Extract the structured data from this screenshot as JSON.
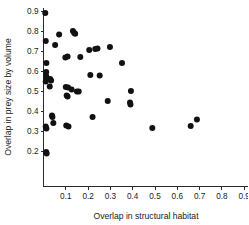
{
  "chart_data": {
    "type": "scatter",
    "title": "",
    "xlabel": "Overlap in structural habitat",
    "ylabel": "Overlap in prey size by volume",
    "xlim": [
      0.0,
      0.93
    ],
    "ylim": [
      0.13,
      0.93
    ],
    "xticks": [
      0.1,
      0.2,
      0.3,
      0.4,
      0.5,
      0.6,
      0.7,
      0.8,
      0.9
    ],
    "xtick_labels": [
      "0.1",
      "0.2",
      "0.3",
      "0.4",
      "0.5",
      "0.6",
      "0.7",
      "0.8",
      "0.9"
    ],
    "yticks": [
      0.2,
      0.3,
      0.4,
      0.5,
      0.6,
      0.7,
      0.8,
      0.9
    ],
    "ytick_labels": [
      "0.2",
      "0.3",
      "0.4",
      "0.5",
      "0.6",
      "0.7",
      "0.8",
      "0.9"
    ],
    "grid": false,
    "legend": false,
    "marker": "filled-circle",
    "marker_color": "#111111",
    "marker_size": 3.0,
    "points": [
      {
        "x": 0.008,
        "y": 0.89
      },
      {
        "x": 0.01,
        "y": 0.75
      },
      {
        "x": 0.013,
        "y": 0.64
      },
      {
        "x": 0.012,
        "y": 0.595
      },
      {
        "x": 0.012,
        "y": 0.575
      },
      {
        "x": 0.014,
        "y": 0.558
      },
      {
        "x": 0.01,
        "y": 0.548
      },
      {
        "x": 0.03,
        "y": 0.56
      },
      {
        "x": 0.034,
        "y": 0.553
      },
      {
        "x": 0.028,
        "y": 0.522
      },
      {
        "x": 0.01,
        "y": 0.322
      },
      {
        "x": 0.013,
        "y": 0.312
      },
      {
        "x": 0.012,
        "y": 0.195
      },
      {
        "x": 0.014,
        "y": 0.188
      },
      {
        "x": 0.038,
        "y": 0.378
      },
      {
        "x": 0.04,
        "y": 0.37
      },
      {
        "x": 0.044,
        "y": 0.34
      },
      {
        "x": 0.052,
        "y": 0.73
      },
      {
        "x": 0.07,
        "y": 0.782
      },
      {
        "x": 0.098,
        "y": 0.668
      },
      {
        "x": 0.108,
        "y": 0.672
      },
      {
        "x": 0.1,
        "y": 0.52
      },
      {
        "x": 0.11,
        "y": 0.518
      },
      {
        "x": 0.104,
        "y": 0.478
      },
      {
        "x": 0.108,
        "y": 0.472
      },
      {
        "x": 0.102,
        "y": 0.328
      },
      {
        "x": 0.112,
        "y": 0.322
      },
      {
        "x": 0.132,
        "y": 0.8
      },
      {
        "x": 0.138,
        "y": 0.79
      },
      {
        "x": 0.142,
        "y": 0.786
      },
      {
        "x": 0.126,
        "y": 0.508
      },
      {
        "x": 0.165,
        "y": 0.67
      },
      {
        "x": 0.15,
        "y": 0.498
      },
      {
        "x": 0.158,
        "y": 0.498
      },
      {
        "x": 0.205,
        "y": 0.705
      },
      {
        "x": 0.232,
        "y": 0.71
      },
      {
        "x": 0.242,
        "y": 0.712
      },
      {
        "x": 0.21,
        "y": 0.58
      },
      {
        "x": 0.252,
        "y": 0.578
      },
      {
        "x": 0.22,
        "y": 0.37
      },
      {
        "x": 0.298,
        "y": 0.72
      },
      {
        "x": 0.288,
        "y": 0.45
      },
      {
        "x": 0.352,
        "y": 0.64
      },
      {
        "x": 0.392,
        "y": 0.5
      },
      {
        "x": 0.388,
        "y": 0.442
      },
      {
        "x": 0.39,
        "y": 0.432
      },
      {
        "x": 0.488,
        "y": 0.315
      },
      {
        "x": 0.66,
        "y": 0.325
      },
      {
        "x": 0.688,
        "y": 0.358
      }
    ]
  }
}
